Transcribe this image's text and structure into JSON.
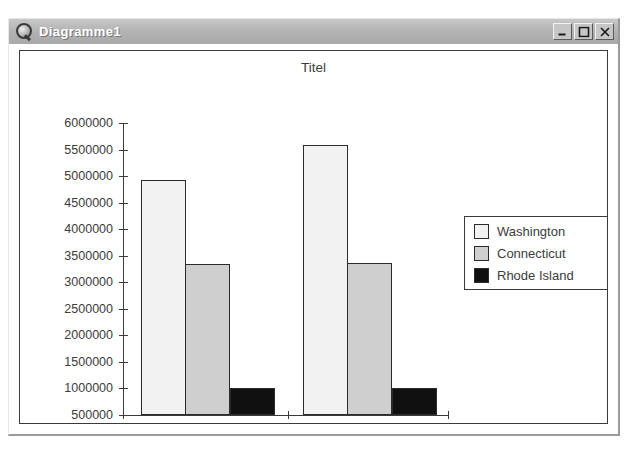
{
  "window": {
    "title": "Diagramme1",
    "icon": "magnifier-icon",
    "buttons": [
      {
        "name": "minimize-button",
        "label": "Minimize"
      },
      {
        "name": "maximize-button",
        "label": "Maximize"
      },
      {
        "name": "close-button",
        "label": "Close"
      }
    ]
  },
  "chart_data": {
    "type": "bar",
    "title": "Titel",
    "xlabel": "",
    "ylabel": "",
    "categories": [
      "Pop1990",
      "Pop1997"
    ],
    "series": [
      {
        "name": "Washington",
        "color": "#f2f2f2",
        "values": [
          4925000,
          5590000
        ]
      },
      {
        "name": "Connecticut",
        "color": "#cfcfcf",
        "values": [
          3345000,
          3365000
        ]
      },
      {
        "name": "Rhode Island",
        "color": "#101010",
        "values": [
          1000000,
          1000000
        ]
      }
    ],
    "ylim": [
      500000,
      6000000
    ],
    "yticks": [
      "6000000",
      "5500000",
      "5000000",
      "4500000",
      "4000000",
      "3500000",
      "3000000",
      "2500000",
      "2000000",
      "1500000",
      "1000000",
      "500000"
    ],
    "grid": false,
    "legend_position": "right",
    "legend_entries": [
      "Washington",
      "Connecticut",
      "Rhode Island"
    ]
  }
}
